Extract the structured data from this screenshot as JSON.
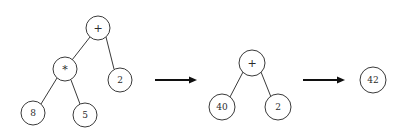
{
  "diagram": {
    "type": "expression-tree-reduction",
    "background_color": "#ffffff",
    "node_stroke_color": "#3a3a3a",
    "node_fill_color": "#ffffff",
    "label_color": "#2b2b2b",
    "arrow_color": "#101010",
    "stages": [
      {
        "id": "stage-1",
        "nodes": [
          {
            "id": "n1-root",
            "label": "+",
            "cx": 98,
            "cy": 28,
            "r": 12,
            "font_size": 11
          },
          {
            "id": "n1-mul",
            "label": "*",
            "cx": 65,
            "cy": 69,
            "r": 12,
            "font_size": 11
          },
          {
            "id": "n1-two",
            "label": "2",
            "cx": 120,
            "cy": 80,
            "r": 12,
            "font_size": 9
          },
          {
            "id": "n1-eight",
            "label": "8",
            "cx": 33,
            "cy": 113,
            "r": 12,
            "font_size": 9
          },
          {
            "id": "n1-five",
            "label": "5",
            "cx": 85,
            "cy": 115,
            "r": 12,
            "font_size": 9
          }
        ],
        "edges": [
          {
            "id": "e1-root-mul",
            "x1": 90,
            "y1": 37,
            "x2": 72,
            "y2": 60
          },
          {
            "id": "e1-root-two",
            "x1": 106,
            "y1": 37,
            "x2": 114,
            "y2": 69
          },
          {
            "id": "e1-mul-eight",
            "x1": 57,
            "y1": 78,
            "x2": 41,
            "y2": 104
          },
          {
            "id": "e1-mul-five",
            "x1": 71,
            "y1": 80,
            "x2": 80,
            "y2": 104
          }
        ]
      },
      {
        "id": "stage-2",
        "nodes": [
          {
            "id": "n2-root",
            "label": "+",
            "cx": 252,
            "cy": 63,
            "r": 13,
            "font_size": 11
          },
          {
            "id": "n2-forty",
            "label": "40",
            "cx": 222,
            "cy": 107,
            "r": 13,
            "font_size": 9
          },
          {
            "id": "n2-two",
            "label": "2",
            "cx": 278,
            "cy": 107,
            "r": 13,
            "font_size": 9
          }
        ],
        "edges": [
          {
            "id": "e2-root-forty",
            "x1": 243,
            "y1": 72,
            "x2": 230,
            "y2": 97
          },
          {
            "id": "e2-root-two",
            "x1": 261,
            "y1": 72,
            "x2": 271,
            "y2": 97
          }
        ]
      },
      {
        "id": "stage-3",
        "nodes": [
          {
            "id": "n3-result",
            "label": "42",
            "cx": 373,
            "cy": 80,
            "r": 13,
            "font_size": 9
          }
        ],
        "edges": []
      }
    ],
    "arrows": [
      {
        "id": "arrow-1",
        "x1": 155,
        "y1": 80,
        "x2": 197,
        "y2": 80,
        "label": ""
      },
      {
        "id": "arrow-2",
        "x1": 303,
        "y1": 80,
        "x2": 345,
        "y2": 80,
        "label": ""
      }
    ]
  }
}
